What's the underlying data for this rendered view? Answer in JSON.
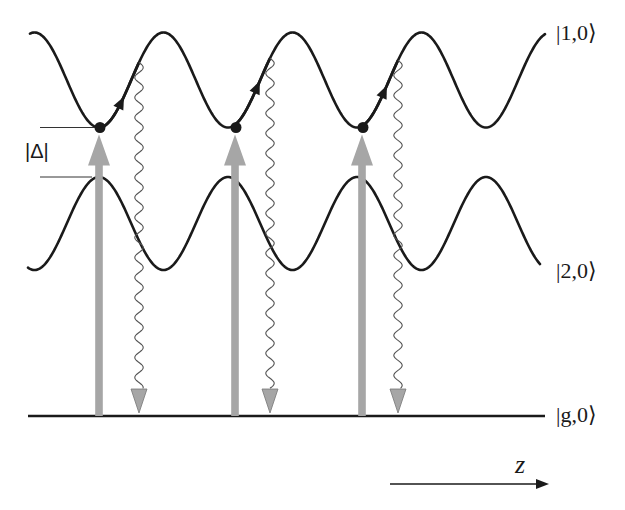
{
  "figure": {
    "type": "energy-level diagram",
    "states": {
      "upper": "|1,0⟩",
      "lower": "|2,0⟩",
      "ground": "|g,0⟩"
    },
    "gap_label": "|Δ|",
    "axis_label": "z",
    "colors": {
      "curve": "#1a1a1a",
      "pump_arrow": "#a6a6a6",
      "decay_line": "#555555",
      "decay_head": "#a6a6a6"
    },
    "curves": {
      "upper": {
        "center_y": 80,
        "amplitude": 47.5,
        "x_start": 30,
        "x_end": 545
      },
      "lower": {
        "center_y": 223.5,
        "amplitude": 46.5,
        "x_start": 28,
        "x_end": 540
      },
      "period_px": 129,
      "phase_min_x": 99
    },
    "baseline": {
      "y": 416,
      "x_start": 28,
      "x_end": 545
    },
    "excitations": [
      {
        "x": 99,
        "decay_x": 139
      },
      {
        "x": 235,
        "decay_x": 270
      },
      {
        "x": 362,
        "decay_x": 398
      }
    ],
    "z_arrow": {
      "x_start": 390,
      "x_end": 548,
      "y": 484
    }
  }
}
